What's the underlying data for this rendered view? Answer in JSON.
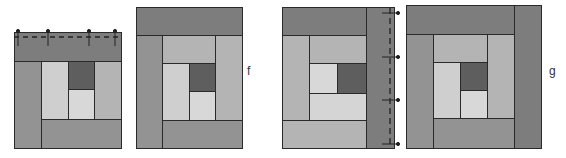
{
  "colors": {
    "darkest_band": "#7d7d7d",
    "mid_band": "#939393",
    "light_band": "#b4b4b4",
    "lightest": "#d5d5d5",
    "center_dark": "#5e5e5e",
    "outline": "#2a2a2a",
    "pins": "#222222"
  },
  "diagram": {
    "panels": [
      {
        "id": "step-e",
        "label": "",
        "note": "top strip pinned along dashed seam"
      },
      {
        "id": "step-f",
        "label": "f"
      },
      {
        "id": "step-h",
        "label": "",
        "note": "right strip pinned along dashed seam"
      },
      {
        "id": "step-g",
        "label": "g"
      }
    ]
  }
}
